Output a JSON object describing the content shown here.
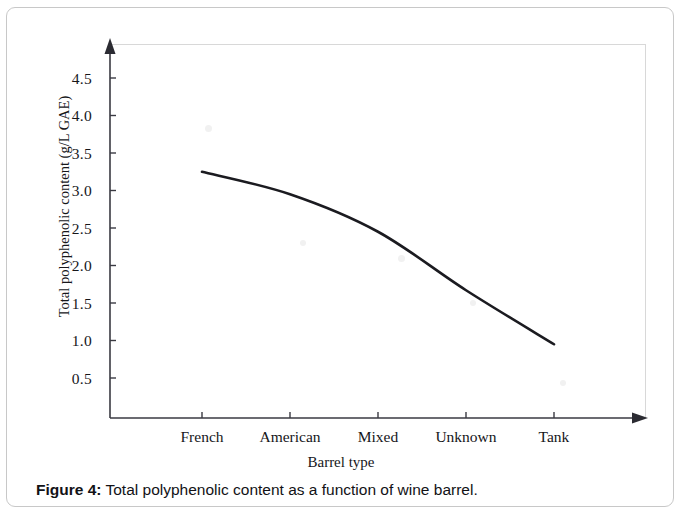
{
  "figure": {
    "caption_label": "Figure 4:",
    "caption_text": "Total polyphenolic content as a function of wine barrel."
  },
  "chart_data": {
    "type": "line",
    "title": "",
    "xlabel": "Barrel type",
    "ylabel": "Total polyphenolic content (g/L GAE)",
    "categories": [
      "French",
      "American",
      "Mixed",
      "Unknown",
      "Tank"
    ],
    "values": [
      3.25,
      2.95,
      2.45,
      1.67,
      0.95
    ],
    "ytick_labels": [
      "4.5",
      "4.0",
      "3.5",
      "3.0",
      "2.5",
      "2.0",
      "1.5",
      "1.0",
      "0.5"
    ],
    "ytick_values": [
      4.5,
      4.0,
      3.5,
      3.0,
      2.5,
      2.0,
      1.5,
      1.0,
      0.5
    ],
    "ylim": [
      0,
      4.85
    ],
    "grid": false,
    "legend": "none",
    "line_color": "#1b1b20",
    "axis_color": "#3a3a42"
  }
}
